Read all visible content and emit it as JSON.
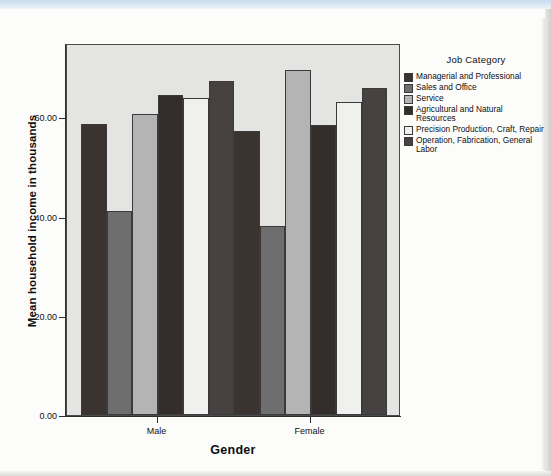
{
  "chart_data": {
    "type": "bar",
    "title": "",
    "xlabel": "Gender",
    "ylabel": "Mean household income in thousands",
    "categories": [
      "Male",
      "Female"
    ],
    "ylim": [
      0,
      75
    ],
    "yticks": [
      0,
      20,
      40,
      60
    ],
    "ytick_labels": [
      "0.00",
      "20.00",
      "40.00",
      "60.00"
    ],
    "grid": false,
    "legend_title": "Job Category",
    "legend_position": "right",
    "series": [
      {
        "name": "Managerial and Professional",
        "color": "#3a3330",
        "values": [
          58.7,
          57.2
        ]
      },
      {
        "name": "Sales and Office",
        "color": "#6e6e6e",
        "values": [
          41.1,
          38.1
        ]
      },
      {
        "name": "Service",
        "color": "#b4b4b4",
        "values": [
          60.7,
          69.6
        ]
      },
      {
        "name": "Agricultural and Natural Resources",
        "color": "#332d2b",
        "values": [
          64.5,
          58.5
        ]
      },
      {
        "name": "Precision Production, Craft, Repair",
        "color": "#f0f0ee",
        "values": [
          63.9,
          63.2
        ]
      },
      {
        "name": "Operation, Fabrication, General Labor",
        "color": "#474241",
        "values": [
          67.4,
          66.0
        ]
      }
    ]
  },
  "axis": {
    "y_title": "Mean household income in thousands",
    "x_title": "Gender",
    "y_tick_labels": [
      "60.00",
      "40.00",
      "20.00",
      "0.00"
    ],
    "x_tick_labels": [
      "Male",
      "Female"
    ]
  },
  "legend": {
    "title": "Job Category",
    "items": [
      {
        "label": "Managerial and Professional",
        "color": "#3a3330"
      },
      {
        "label": "Sales and Office",
        "color": "#6e6e6e"
      },
      {
        "label": "Service",
        "color": "#b4b4b4"
      },
      {
        "label": "Agricultural and Natural Resources",
        "color": "#332d2b"
      },
      {
        "label": "Precision Production, Craft, Repair",
        "color": "#f0f0ee"
      },
      {
        "label": "Operation, Fabrication, General Labor",
        "color": "#474241"
      }
    ]
  }
}
